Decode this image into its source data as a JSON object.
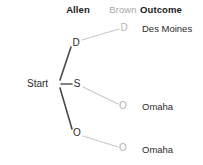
{
  "diagram": {
    "type": "decision-tree",
    "canvas": {
      "width": 203,
      "height": 165
    },
    "headers": [
      {
        "key": "allen",
        "label": "Allen",
        "x": 78,
        "y": 10,
        "style": "bold-dark"
      },
      {
        "key": "brown",
        "label": "Brown",
        "x": 123,
        "y": 10,
        "style": "muted"
      },
      {
        "key": "outcome",
        "label": "Outcome",
        "x": 140,
        "y": 10,
        "style": "bold-dark-left"
      }
    ],
    "root": {
      "label": "Start",
      "x": 57,
      "y": 84,
      "text_x": 27,
      "text_y": 84
    },
    "level1_nodes": [
      {
        "id": "allen-d",
        "label": "D",
        "x": 76,
        "y": 43
      },
      {
        "id": "allen-s",
        "label": "S",
        "x": 77,
        "y": 84
      },
      {
        "id": "allen-o",
        "label": "O",
        "x": 77,
        "y": 133
      }
    ],
    "level2_nodes": [
      {
        "id": "brown-d",
        "label": "D",
        "x": 124,
        "y": 28
      },
      {
        "id": "brown-o-1",
        "label": "O",
        "x": 123,
        "y": 106
      },
      {
        "id": "brown-o-2",
        "label": "O",
        "x": 123,
        "y": 148
      }
    ],
    "outcomes": [
      {
        "id": "outcome-1",
        "label": "Des Moines",
        "x": 142,
        "y": 29
      },
      {
        "id": "outcome-2",
        "label": "Omaha",
        "x": 142,
        "y": 107
      },
      {
        "id": "outcome-3",
        "label": "Omaha",
        "x": 142,
        "y": 150
      }
    ],
    "edges_level1": [
      {
        "id": "edge-start-d",
        "x1": 60,
        "y1": 80,
        "x2": 71,
        "y2": 47
      },
      {
        "id": "edge-start-s",
        "x1": 61,
        "y1": 84,
        "x2": 72,
        "y2": 84
      },
      {
        "id": "edge-start-o",
        "x1": 60,
        "y1": 88,
        "x2": 72,
        "y2": 129
      }
    ],
    "edges_level2": [
      {
        "id": "edge-d-d",
        "x1": 82,
        "y1": 40,
        "x2": 119,
        "y2": 29
      },
      {
        "id": "edge-s-o",
        "x1": 83,
        "y1": 87,
        "x2": 118,
        "y2": 104
      },
      {
        "id": "edge-o-o",
        "x1": 83,
        "y1": 136,
        "x2": 118,
        "y2": 147
      }
    ],
    "colors": {
      "edge_dark": "#4a4a4a",
      "edge_light": "#c9c9c9",
      "text_dark": "#2b2b2b",
      "text_muted": "#a8a8a8",
      "node_light": "#b4b4b4",
      "background": "#ffffff"
    }
  }
}
